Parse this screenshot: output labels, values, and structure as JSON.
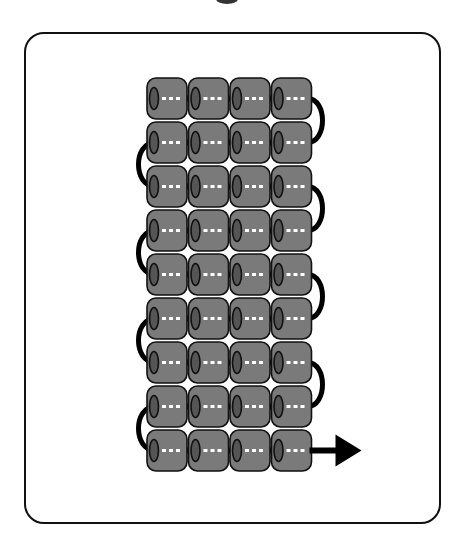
{
  "diagram": {
    "type": "bead-weaving-pattern",
    "stitch": "ladder/square stitch",
    "rows": 9,
    "columns": 4,
    "bead_shape": "cylinder",
    "colors": {
      "bead_fill": "#7a7a7a",
      "bead_outline": "#111111",
      "hole_fill": "#555555",
      "thread": "#000000",
      "thread_dashes": "#ffffff",
      "card_border": "#111111",
      "background": "#ffffff"
    },
    "thread_turns": {
      "right_side": [
        [
          1,
          2
        ],
        [
          3,
          4
        ],
        [
          5,
          6
        ],
        [
          7,
          8
        ]
      ],
      "left_side": [
        [
          2,
          3
        ],
        [
          4,
          5
        ],
        [
          6,
          7
        ],
        [
          8,
          9
        ]
      ]
    },
    "exit_arrow": {
      "row": 9,
      "direction": "right",
      "icon": "arrow-right-icon"
    }
  }
}
